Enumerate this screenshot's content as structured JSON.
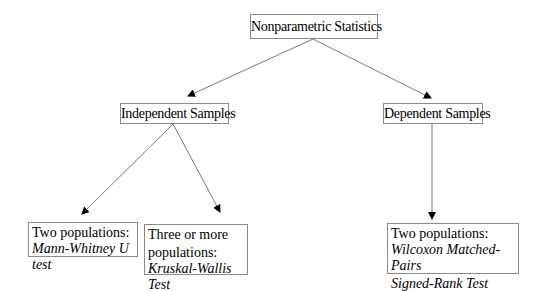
{
  "diagram": {
    "root": {
      "label": "Nonparametric Statistics"
    },
    "branches": [
      {
        "label": "Independent Samples"
      },
      {
        "label": "Dependent Samples"
      }
    ],
    "leaves": [
      {
        "heading": "Two populations:",
        "test": "Mann-Whitney U test"
      },
      {
        "heading_line1": "Three or more",
        "heading_line2": "populations:",
        "test": "Kruskal-Wallis Test"
      },
      {
        "heading": "Two populations:",
        "test_line1": "Wilcoxon Matched-Pairs",
        "test_line2": "Signed-Rank Test"
      }
    ],
    "edges": [
      {
        "from": "Nonparametric Statistics",
        "to": "Independent Samples"
      },
      {
        "from": "Nonparametric Statistics",
        "to": "Dependent Samples"
      },
      {
        "from": "Independent Samples",
        "to": "Mann-Whitney U test"
      },
      {
        "from": "Independent Samples",
        "to": "Kruskal-Wallis Test"
      },
      {
        "from": "Dependent Samples",
        "to": "Wilcoxon Matched-Pairs Signed-Rank Test"
      }
    ],
    "colors": {
      "line": "#7a7a7a",
      "arrowhead": "#000000",
      "border": "#8a8a8a"
    }
  }
}
